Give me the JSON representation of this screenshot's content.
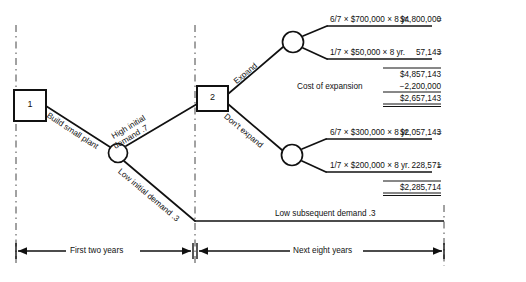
{
  "diagram": {
    "decision_nodes": [
      {
        "id": "1",
        "label": "1"
      },
      {
        "id": "2",
        "label": "2"
      }
    ],
    "branches": {
      "build_small_plant": "Build small plant",
      "high_initial_demand": "High initial",
      "high_initial_demand_2": "demand .7",
      "low_initial_demand": "Low initial demand .3",
      "expand": "Expand",
      "dont_expand": "Don't expand",
      "low_subsequent_demand": "Low subsequent demand .3"
    },
    "outcomes": [
      {
        "formula": "6/7 × $700,000 × 8 yr.",
        "equals": "=",
        "value": "$4,800,000"
      },
      {
        "formula": "1/7 × $50,000 × 8 yr.",
        "equals": "=",
        "value": "57,143"
      },
      {
        "formula": "6/7 × $300,000 × 8 yr.",
        "equals": "=",
        "value": "$2,057,143"
      },
      {
        "formula": "1/7 × $200,000 × 8 yr.",
        "equals": "=",
        "value": "228,571"
      }
    ],
    "expand_totals": {
      "subtotal": "$4,857,143",
      "cost_label": "Cost of expansion",
      "cost_value": "−2,200,000",
      "total": "$2,657,143"
    },
    "no_expand_totals": {
      "total": "$2,285,714"
    },
    "timeline": {
      "first_period": "First two years",
      "second_period": "Next eight years"
    }
  }
}
